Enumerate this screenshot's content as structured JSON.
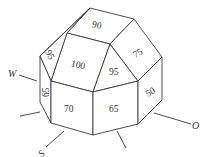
{
  "figure": {
    "type": "polyhedral-dome-diagram",
    "faces": [
      {
        "id": "top",
        "label": "90"
      },
      {
        "id": "upper-front",
        "label": "100"
      },
      {
        "id": "upper-left-small",
        "label": "95"
      },
      {
        "id": "upper-front-right",
        "label": "95"
      },
      {
        "id": "upper-right",
        "label": "75"
      },
      {
        "id": "side-left",
        "label": "65"
      },
      {
        "id": "front-left",
        "label": "70"
      },
      {
        "id": "front-right",
        "label": "65"
      },
      {
        "id": "side-right",
        "label": "50"
      }
    ],
    "directions": [
      {
        "id": "west",
        "label": "W"
      },
      {
        "id": "south",
        "label": "S"
      },
      {
        "id": "east",
        "label": "O"
      }
    ]
  }
}
